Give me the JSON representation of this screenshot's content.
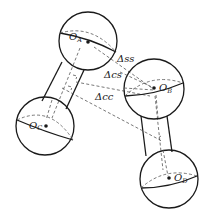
{
  "diagram": {
    "title": "",
    "spheres": [
      {
        "id": "A",
        "label": "O",
        "sub": "A",
        "cx": 88,
        "cy": 41,
        "r": 29
      },
      {
        "id": "B",
        "label": "O",
        "sub": "B",
        "cx": 154,
        "cy": 89,
        "r": 30
      },
      {
        "id": "C",
        "label": "O",
        "sub": "C",
        "cx": 45,
        "cy": 126,
        "r": 29
      },
      {
        "id": "D",
        "label": "O",
        "sub": "D",
        "cx": 169,
        "cy": 179,
        "r": 29
      }
    ],
    "cylinders": [
      {
        "from": "A",
        "to": "C"
      },
      {
        "from": "B",
        "to": "D"
      }
    ],
    "distances": [
      {
        "id": "ss",
        "label": "Δss"
      },
      {
        "id": "cs",
        "label": "Δcs"
      },
      {
        "id": "cc",
        "label": "Δcc"
      }
    ]
  }
}
